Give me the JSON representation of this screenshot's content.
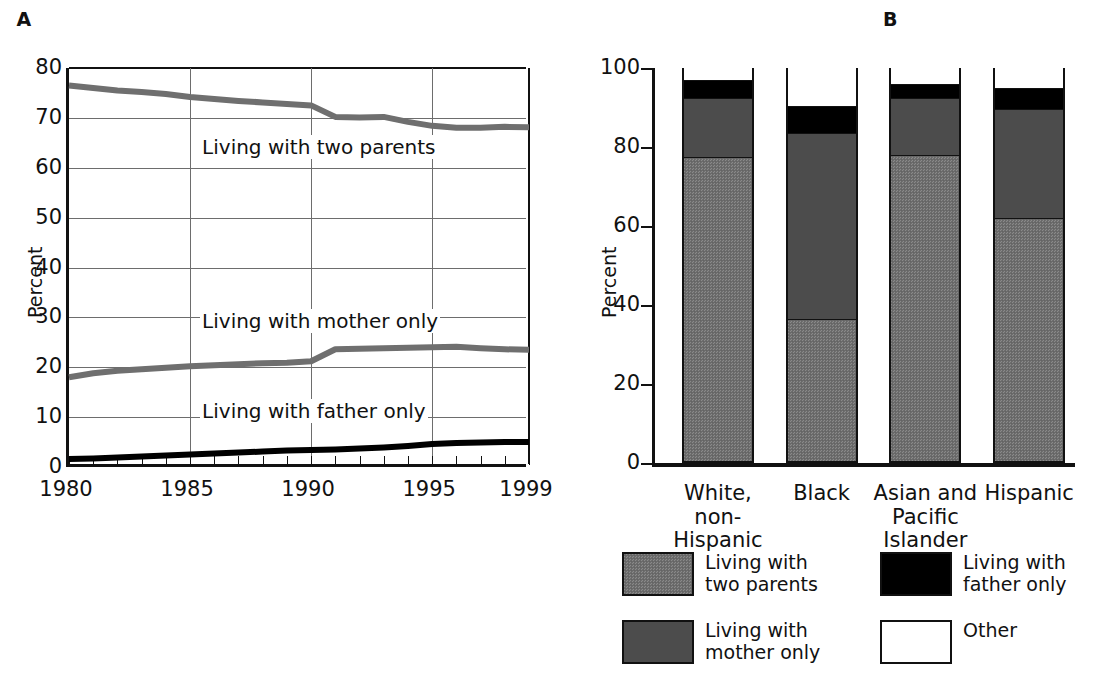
{
  "figure": {
    "panel_a_title": "A",
    "panel_b_title": "B",
    "ylabel": "Percent"
  },
  "chart_data": [
    {
      "type": "line",
      "title": "A",
      "xlabel": "",
      "ylabel": "Percent",
      "xlim": [
        1980,
        1999
      ],
      "ylim": [
        0,
        80
      ],
      "yticks": [
        0,
        10,
        20,
        30,
        40,
        50,
        60,
        70,
        80
      ],
      "xticks": [
        1980,
        1985,
        1990,
        1995,
        1999
      ],
      "grid": true,
      "x": [
        1980,
        1981,
        1982,
        1983,
        1984,
        1985,
        1986,
        1987,
        1988,
        1989,
        1990,
        1991,
        1992,
        1993,
        1994,
        1995,
        1996,
        1997,
        1998,
        1999
      ],
      "series": [
        {
          "name": "Living with two parents",
          "color": "#6f6f6f",
          "values": [
            76.5,
            76.0,
            75.5,
            75.2,
            74.8,
            74.2,
            73.8,
            73.4,
            73.1,
            72.8,
            72.5,
            70.2,
            70.1,
            70.2,
            69.2,
            68.4,
            68.0,
            68.0,
            68.2,
            68.1
          ]
        },
        {
          "name": "Living with mother only",
          "color": "#6f6f6f",
          "values": [
            18.0,
            18.8,
            19.3,
            19.6,
            19.9,
            20.2,
            20.4,
            20.6,
            20.8,
            20.9,
            21.2,
            23.6,
            23.7,
            23.8,
            23.9,
            24.0,
            24.1,
            23.8,
            23.6,
            23.5
          ]
        },
        {
          "name": "Living with father only",
          "color": "#000000",
          "values": [
            1.6,
            1.7,
            1.9,
            2.1,
            2.3,
            2.5,
            2.7,
            2.9,
            3.1,
            3.3,
            3.4,
            3.5,
            3.7,
            3.9,
            4.2,
            4.6,
            4.8,
            4.9,
            5.0,
            5.0
          ]
        }
      ],
      "annotations": [
        {
          "text": "Living with two parents",
          "x": 1990,
          "y": 64
        },
        {
          "text": "Living with mother only",
          "x": 1990,
          "y": 29
        },
        {
          "text": "Living with father only",
          "x": 1990,
          "y": 11
        }
      ]
    },
    {
      "type": "bar",
      "stacked": true,
      "title": "B",
      "xlabel": "",
      "ylabel": "Percent",
      "ylim": [
        0,
        100
      ],
      "yticks": [
        0,
        20,
        40,
        60,
        80,
        100
      ],
      "grid": false,
      "categories": [
        "White,\nnon-Hispanic",
        "Black",
        "Asian and\nPacific\nIslander",
        "Hispanic"
      ],
      "series": [
        {
          "name": "Living with two parents",
          "color": "#6f6f6f",
          "values": [
            77,
            36,
            77.5,
            61.5
          ]
        },
        {
          "name": "Living with mother only",
          "color": "#4c4c4c",
          "values": [
            15,
            47,
            14.5,
            27.5
          ]
        },
        {
          "name": "Living with father only",
          "color": "#000000",
          "values": [
            4.5,
            7,
            3.5,
            5.5
          ]
        },
        {
          "name": "Other",
          "color": "#ffffff",
          "values": [
            3.5,
            10,
            4.5,
            5.5
          ]
        }
      ]
    }
  ],
  "legend": {
    "items": [
      {
        "label": "Living with\ntwo parents",
        "swatch": "two-parents"
      },
      {
        "label": "Living with\nmother only",
        "swatch": "mother-only"
      },
      {
        "label": "Living with\nfather only",
        "swatch": "father-only"
      },
      {
        "label": "Other",
        "swatch": "other"
      }
    ]
  }
}
